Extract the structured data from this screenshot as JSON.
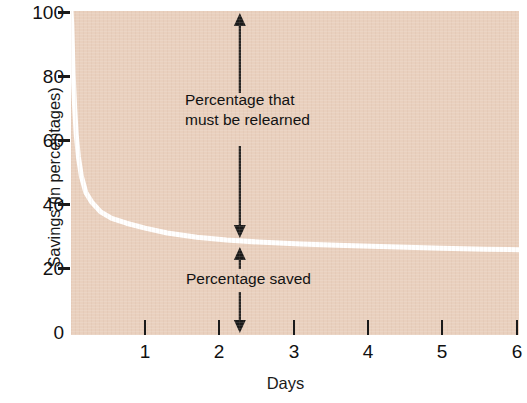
{
  "chart_data": {
    "type": "line",
    "title": "",
    "xlabel": "Days",
    "ylabel": "Savings (in percentages)",
    "xlim": [
      0,
      6.05
    ],
    "ylim": [
      0,
      100
    ],
    "x_ticks": [
      1,
      2,
      3,
      4,
      5,
      6
    ],
    "x_tick_labels": [
      "1",
      "2",
      "3",
      "4",
      "5",
      "6"
    ],
    "y_ticks": [
      0,
      20,
      40,
      60,
      80,
      100
    ],
    "y_tick_labels": [
      "0",
      "20",
      "40",
      "60",
      "80",
      "100"
    ],
    "grid": false,
    "legend": "none",
    "plot_background_color": "#e9d0be",
    "line_color": "#ffffff",
    "line_width": 5,
    "series": [
      {
        "name": "Savings",
        "x": [
          0.0,
          0.01,
          0.02,
          0.03,
          0.05,
          0.07,
          0.1,
          0.14,
          0.2,
          0.28,
          0.4,
          0.55,
          0.75,
          1.0,
          1.3,
          1.7,
          2.1,
          2.6,
          3.1,
          3.7,
          4.3,
          5.0,
          5.6,
          6.05
        ],
        "values": [
          100,
          96,
          88,
          80,
          70,
          62,
          55,
          49,
          44,
          41,
          38,
          36,
          34.5,
          33,
          31.5,
          30.2,
          29.3,
          28.6,
          28.1,
          27.6,
          27.2,
          26.8,
          26.5,
          26.3
        ]
      }
    ],
    "annotations": [
      {
        "name": "percentage-relearned",
        "text_line1": "Percentage that",
        "text_line2": "must be relearned",
        "arrow_top_value": 100,
        "arrow_bottom_value": 29,
        "arrow_x_day": 2.28,
        "double_headed": true
      },
      {
        "name": "percentage-saved",
        "text_line1": "Percentage saved",
        "text_line2": "",
        "arrow_top_value": 29,
        "arrow_bottom_value": 0,
        "arrow_x_day": 2.28,
        "double_headed": true
      }
    ]
  },
  "axes": {
    "y_title": "Savings (in percentages)",
    "x_title": "Days",
    "y_tick_labels": [
      "100",
      "80",
      "60",
      "40",
      "20",
      "0"
    ],
    "x_tick_labels": [
      "1",
      "2",
      "3",
      "4",
      "5",
      "6"
    ]
  },
  "annotations": {
    "relearn_line1": "Percentage that",
    "relearn_line2": "must be relearned",
    "saved_line1": "Percentage saved"
  },
  "colors": {
    "plot_bg": "#e9d0be",
    "curve": "#ffffff",
    "ink": "#111111",
    "page_bg": "#ffffff"
  }
}
